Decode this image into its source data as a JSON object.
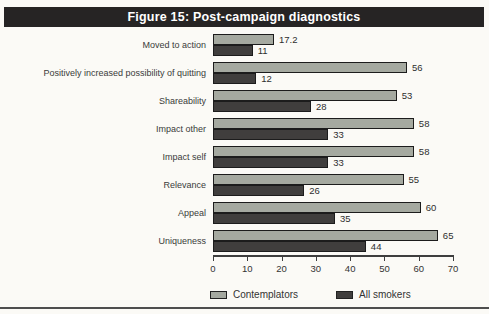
{
  "figure": {
    "title": "Figure 15: Post-campaign diagnostics",
    "title_bar_bg": "#262424",
    "background": "#fbfaf6"
  },
  "chart_data": {
    "type": "bar",
    "orientation": "horizontal",
    "title": "Figure 15: Post-campaign diagnostics",
    "categories": [
      "Moved to action",
      "Positively increased possibility of quitting",
      "Shareability",
      "Impact other",
      "Impact self",
      "Relevance",
      "Appeal",
      "Uniqueness"
    ],
    "series": [
      {
        "name": "Contemplators",
        "color": "#a5a9a0",
        "values": [
          17.2,
          56,
          53,
          58,
          58,
          55,
          60,
          65
        ]
      },
      {
        "name": "All smokers",
        "color": "#403e3d",
        "values": [
          11,
          12,
          28,
          33,
          33,
          26,
          35,
          44
        ]
      }
    ],
    "xlim": [
      0,
      70
    ],
    "xticks": [
      0,
      10,
      20,
      30,
      40,
      50,
      60,
      70
    ],
    "value_labels": true,
    "grid": false,
    "legend_position": "bottom"
  }
}
